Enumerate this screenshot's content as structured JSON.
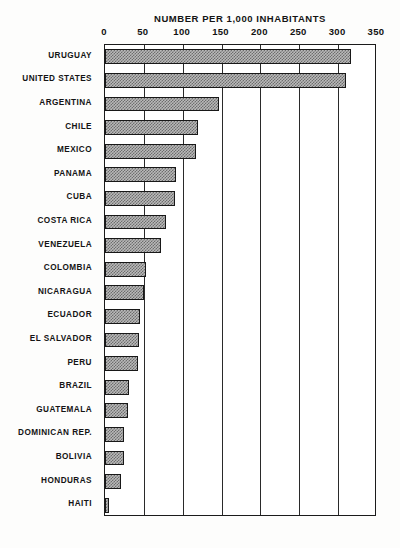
{
  "chart_data": {
    "type": "bar",
    "orientation": "horizontal",
    "title": "NUMBER PER 1,000 INHABITANTS",
    "xlabel": "",
    "ylabel": "",
    "xlim": [
      0,
      350
    ],
    "xticks": [
      0,
      50,
      100,
      150,
      200,
      250,
      300,
      350
    ],
    "xtick_labels": [
      "0",
      "50",
      "100",
      "150",
      "200",
      "250",
      "300",
      "350"
    ],
    "grid": true,
    "legend": "none",
    "categories": [
      "URUGUAY",
      "UNITED STATES",
      "ARGENTINA",
      "CHILE",
      "MEXICO",
      "PANAMA",
      "CUBA",
      "COSTA RICA",
      "VENEZUELA",
      "COLOMBIA",
      "NICARAGUA",
      "ECUADOR",
      "EL SALVADOR",
      "PERU",
      "BRAZIL",
      "GUATEMALA",
      "DOMINICAN REP.",
      "BOLIVIA",
      "HONDURAS",
      "HAITI"
    ],
    "values": [
      317,
      310,
      147,
      120,
      117,
      92,
      90,
      78,
      72,
      53,
      50,
      45,
      44,
      43,
      31,
      30,
      25,
      24,
      21,
      5
    ]
  },
  "footnote": "",
  "colors": {
    "bar_fill": "#b9b9b9",
    "bar_hatch": "#6d6d6d",
    "bar_outline": "#181818",
    "frame": "#1b1b1b",
    "text": "#141414",
    "background": "#fdfdfc"
  }
}
